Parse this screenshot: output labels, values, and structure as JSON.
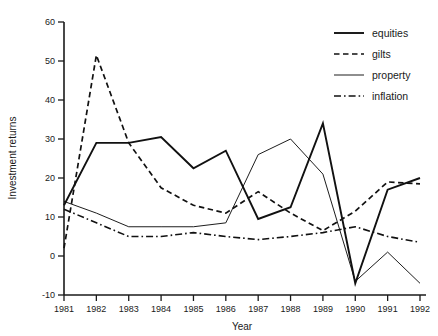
{
  "chart_data": {
    "type": "line",
    "title": "",
    "xlabel": "Year",
    "ylabel": "Investment returns",
    "x": [
      1981,
      1982,
      1983,
      1984,
      1985,
      1986,
      1987,
      1988,
      1989,
      1990,
      1991,
      1992
    ],
    "xtick_labels": [
      "1981",
      "1982",
      "1983",
      "1984",
      "1985",
      "1986",
      "1987",
      "1988",
      "1989",
      "1990",
      "1991",
      "1992"
    ],
    "ytick_labels": [
      "60",
      "50",
      "40",
      "30",
      "20",
      "10",
      "0",
      "-10"
    ],
    "yticks": [
      60,
      50,
      40,
      30,
      20,
      10,
      0,
      -10
    ],
    "xlim": [
      1981,
      1992
    ],
    "ylim": [
      -10,
      60
    ],
    "grid": false,
    "legend_position": "top-right",
    "series": [
      {
        "name": "equities",
        "style": "solid-thick",
        "color": "#111111",
        "values": [
          13,
          29,
          29,
          30.5,
          22.5,
          27,
          9.5,
          12.5,
          34,
          -7,
          17,
          20
        ]
      },
      {
        "name": "gilts",
        "style": "dashed",
        "color": "#111111",
        "values": [
          2,
          51.5,
          29,
          17.5,
          13,
          11,
          16.5,
          11,
          6.5,
          11.5,
          19,
          18.5
        ]
      },
      {
        "name": "property",
        "style": "solid-thin",
        "color": "#111111",
        "values": [
          14,
          11,
          7.5,
          7.5,
          7.5,
          8.5,
          26,
          30,
          21,
          -6.5,
          1,
          -7
        ]
      },
      {
        "name": "inflation",
        "style": "dash-dot",
        "color": "#111111",
        "values": [
          12,
          8.5,
          5,
          5,
          6,
          5,
          4.2,
          5,
          6,
          7.5,
          5,
          3.5
        ]
      }
    ]
  },
  "legend": {
    "items": [
      {
        "label": "equities"
      },
      {
        "label": "gilts"
      },
      {
        "label": "property"
      },
      {
        "label": "inflation"
      }
    ]
  },
  "axes": {
    "x_title": "Year",
    "y_title": "Investment returns"
  }
}
